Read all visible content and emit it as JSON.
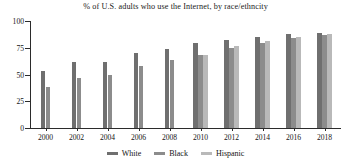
{
  "chart_data": {
    "type": "bar",
    "title": "% of U.S. adults who use the Internet, by race/ethncity",
    "xlabel": "",
    "ylabel": "",
    "ylim": [
      0,
      100
    ],
    "yticks": [
      0,
      25,
      50,
      75,
      100
    ],
    "grid": false,
    "legend_position": "bottom",
    "categories": [
      "2000",
      "2002",
      "2004",
      "2006",
      "2008",
      "2010",
      "2012",
      "2014",
      "2016",
      "2018"
    ],
    "series": [
      {
        "name": "White",
        "color": "#6f6f6f",
        "values": [
          53,
          62,
          62,
          70,
          74,
          79,
          82,
          85,
          88,
          89
        ]
      },
      {
        "name": "Black",
        "color": "#8c8c8c",
        "values": [
          38,
          47,
          50,
          58,
          64,
          68,
          75,
          79,
          84,
          87
        ]
      },
      {
        "name": "Hispanic",
        "color": "#b9b9b9",
        "values": [
          null,
          null,
          null,
          null,
          null,
          68,
          77,
          81,
          85,
          88
        ]
      }
    ]
  },
  "axis": {
    "y_tick_labels": [
      "100",
      "75",
      "50",
      "25",
      "0"
    ],
    "x_tick_labels": [
      "2000",
      "2002",
      "2004",
      "2006",
      "2008",
      "2010",
      "2012",
      "2014",
      "2016",
      "2018"
    ]
  },
  "legend": {
    "items": [
      {
        "label": "White",
        "color": "#6f6f6f"
      },
      {
        "label": "Black",
        "color": "#8c8c8c"
      },
      {
        "label": "Hispanic",
        "color": "#b9b9b9"
      }
    ]
  }
}
